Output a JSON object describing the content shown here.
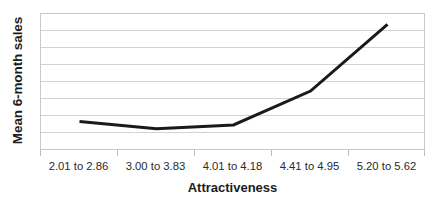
{
  "chart_data": {
    "type": "line",
    "title": "",
    "xlabel": "Attractiveness",
    "ylabel": "Mean 6-month sales",
    "categories": [
      "2.01 to 2.86",
      "3.00 to 3.83",
      "4.01 to 4.18",
      "4.41 to 4.95",
      "5.20 to 5.62"
    ],
    "values": [
      1.72,
      1.3,
      1.52,
      3.5,
      7.4
    ],
    "ylim": [
      0,
      8
    ],
    "yticks": [
      0,
      1,
      2,
      3,
      4,
      5,
      6,
      7,
      8
    ],
    "ytick_labels": [],
    "grid": "horizontal",
    "legend": "none",
    "series": [
      {
        "name": "Mean 6-month sales",
        "color": "#1a1a1a",
        "line_width": 3,
        "values": [
          1.72,
          1.3,
          1.52,
          3.5,
          7.4
        ]
      }
    ]
  },
  "axes": {
    "y_title": "Mean 6-month sales",
    "x_title": "Attractiveness"
  },
  "style": {
    "line_color": "#1a1a1a",
    "grid_color": "#d3d3d3",
    "frame_color": "#c9c9c9",
    "text_color": "#1c1c1c",
    "background": "#ffffff"
  }
}
